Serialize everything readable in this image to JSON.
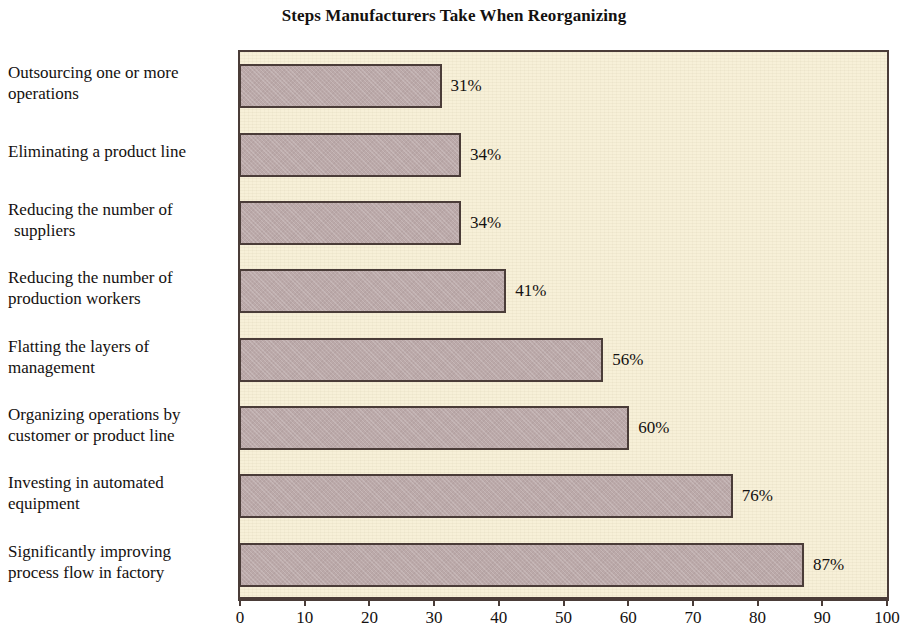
{
  "chart_data": {
    "type": "bar",
    "orientation": "horizontal",
    "title": "Steps Manufacturers Take When Reorganizing",
    "xlabel": "",
    "ylabel": "",
    "xlim": [
      0,
      100
    ],
    "xticks": [
      0,
      10,
      20,
      30,
      40,
      50,
      60,
      70,
      80,
      90,
      100
    ],
    "xtick_labels": [
      "0",
      "10",
      "20",
      "30",
      "40",
      "50",
      "60",
      "70",
      "80",
      "90",
      "100"
    ],
    "grid": false,
    "legend": false,
    "value_suffix": "%",
    "categories": [
      "Outsourcing one or more operations",
      "Eliminating a product line",
      "Reducing the number of suppliers",
      "Reducing the number of production workers",
      "Flatting the layers of management",
      "Organizing operations by customer or product line",
      "Investing in automated equipment",
      "Significantly improving process flow in factory"
    ],
    "values": [
      31,
      34,
      34,
      41,
      56,
      60,
      76,
      87
    ],
    "value_labels": [
      "31%",
      "34%",
      "34%",
      "41%",
      "56%",
      "60%",
      "76%",
      "87%"
    ],
    "bars": [
      {
        "label_line1": "Outsourcing one or more",
        "label_line2": "operations",
        "indent_line2": false,
        "value": 31,
        "value_label": "31%"
      },
      {
        "label_line1": "Eliminating a product line",
        "label_line2": "",
        "indent_line2": false,
        "value": 34,
        "value_label": "34%"
      },
      {
        "label_line1": "Reducing the number of",
        "label_line2": "suppliers",
        "indent_line2": true,
        "value": 34,
        "value_label": "34%"
      },
      {
        "label_line1": "Reducing the number of",
        "label_line2": "production workers",
        "indent_line2": false,
        "value": 41,
        "value_label": "41%"
      },
      {
        "label_line1": "Flatting the layers of",
        "label_line2": "management",
        "indent_line2": false,
        "value": 56,
        "value_label": "56%"
      },
      {
        "label_line1": "Organizing operations by",
        "label_line2": "customer or product line",
        "indent_line2": false,
        "value": 60,
        "value_label": "60%"
      },
      {
        "label_line1": "Investing in automated",
        "label_line2": "equipment",
        "indent_line2": false,
        "value": 76,
        "value_label": "76%"
      },
      {
        "label_line1": "Significantly improving",
        "label_line2": "process flow in factory",
        "indent_line2": false,
        "value": 87,
        "value_label": "87%"
      }
    ],
    "colors": {
      "page_background": "#ffffff",
      "plot_background": "#f7f0d8",
      "bar_fill": "#bba9a9",
      "bar_border": "#4a3c38",
      "frame_border": "#4a3c38",
      "text": "#141110"
    }
  }
}
